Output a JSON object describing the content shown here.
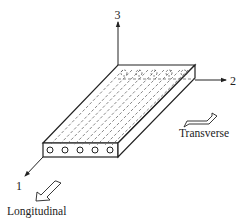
{
  "diagram": {
    "type": "unidirectional-lamina-coordinate-system",
    "axes": [
      {
        "id": "1",
        "label": "1"
      },
      {
        "id": "2",
        "label": "2"
      },
      {
        "id": "3",
        "label": "3"
      }
    ],
    "direction_labels": {
      "longitudinal": "Longitudinal",
      "transverse": "Transverse"
    },
    "fiber_count": 5,
    "colors": {
      "line": "#222222",
      "dashed": "#555555",
      "background": "#ffffff"
    }
  }
}
